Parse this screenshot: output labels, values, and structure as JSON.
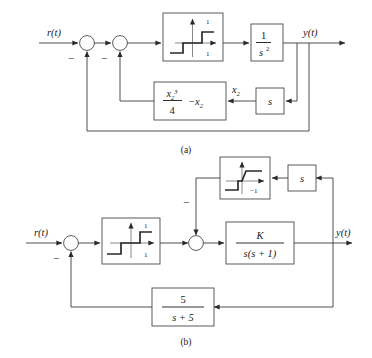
{
  "figure": {
    "captions": [
      {
        "key": "a",
        "label": "(a)"
      },
      {
        "key": "b",
        "label": "(b)"
      }
    ]
  },
  "diagram_a": {
    "caption": "(a)",
    "input_label": "r(t)",
    "output_label": "y(t)",
    "summing_junctions": [
      {
        "name": "sum-1",
        "sign_label": "−"
      },
      {
        "name": "sum-2",
        "sign_label": "−"
      }
    ],
    "blocks": [
      {
        "name": "nonlinearity",
        "type": "relay-deadzone",
        "upper_label": "1",
        "lower_label": "1"
      },
      {
        "name": "double-integrator",
        "type": "transfer-function",
        "numerator": "1",
        "denominator_base": "s",
        "denominator_exponent": "2"
      },
      {
        "name": "cubic-nonlinear-feedback",
        "type": "expression",
        "numerator_base": "x",
        "numerator_sub": "2",
        "numerator_sup": "3",
        "denominator": "4",
        "trailing_term": "−x",
        "trailing_sub": "2"
      },
      {
        "name": "derivative",
        "type": "transfer-function",
        "expression": "s"
      }
    ],
    "signal_labels": [
      {
        "name": "x2-label",
        "base": "x",
        "sub": "2"
      }
    ]
  },
  "diagram_b": {
    "caption": "(b)",
    "input_label": "r(t)",
    "output_label": "y(t)",
    "summing_junctions": [
      {
        "name": "sum-1",
        "sign_label": "−"
      },
      {
        "name": "sum-2",
        "sign_label": "−"
      }
    ],
    "blocks": [
      {
        "name": "inner-nonlinearity",
        "type": "relay-deadzone",
        "lower_label": "−1"
      },
      {
        "name": "derivative",
        "type": "transfer-function",
        "expression": "s"
      },
      {
        "name": "forward-nonlinearity",
        "type": "relay-deadzone",
        "upper_label": "1",
        "lower_label": "1"
      },
      {
        "name": "plant",
        "type": "transfer-function",
        "numerator": "K",
        "denominator": "s(s + 1)"
      },
      {
        "name": "feedback-filter",
        "type": "transfer-function",
        "numerator": "5",
        "denominator": "s + 5"
      }
    ]
  },
  "colors": {
    "line": "#3a3a3a",
    "box_stroke": "#4a4a4a",
    "curve": "#2a2a2a",
    "text": "#1a1a1a",
    "background": "#ffffff"
  }
}
